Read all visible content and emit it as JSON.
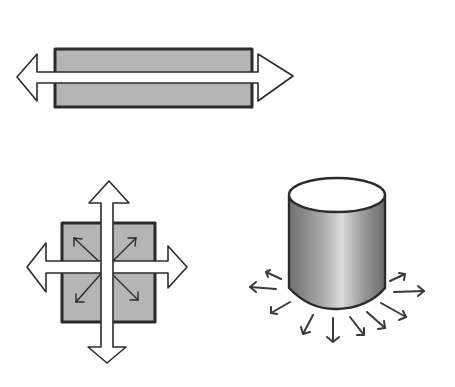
{
  "diagram": {
    "colors": {
      "background": "#ffffff",
      "fill_gray": "#b5b5b5",
      "outline": "#2b2b2b",
      "arrow_fill": "#ffffff",
      "cylinder_dark": "#7d7d7d",
      "cylinder_light": "#d8d8d8"
    },
    "figures": [
      {
        "id": "bar",
        "shape": "horizontal-rectangle",
        "arrows": "bidirectional-horizontal"
      },
      {
        "id": "square",
        "shape": "square",
        "arrows": "four-way-plus-four-diagonal"
      },
      {
        "id": "cylinder",
        "shape": "cylinder",
        "arrows": "radial-outward-from-base",
        "arrow_count": 10
      }
    ]
  }
}
